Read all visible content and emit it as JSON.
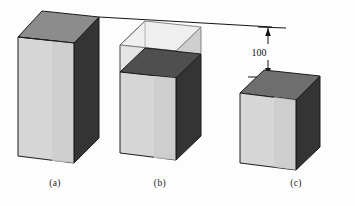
{
  "figure": {
    "background_color": "#fdfdfd",
    "palette": {
      "front_face": "#d6d6d6",
      "front_face_shade": "#c9c9c9",
      "right_face_dark": "#3a3a3a",
      "right_face_darker": "#2e2e2e",
      "top_face_mid": "#8f8f8f",
      "top_face_dark": "#555555",
      "ghost_fill": "#e3e3e3",
      "ghost_top": "#ececec",
      "ghost_right": "#cfcfcf",
      "outline": "#1c1c1c",
      "dimension_line": "#111111"
    },
    "dimension": {
      "value": "100",
      "kind": "vertical-height-difference"
    },
    "captions": [
      {
        "id": "a",
        "label": "(a)",
        "x": 55,
        "y": 186
      },
      {
        "id": "b",
        "label": "(b)",
        "x": 160,
        "y": 186
      },
      {
        "id": "c",
        "label": "(c)",
        "x": 296,
        "y": 186
      }
    ],
    "blocks": [
      {
        "id": "a",
        "name": "tall-block",
        "description": "Full height solid rectangular block",
        "solid": true,
        "ghost_top": false
      },
      {
        "id": "b",
        "name": "block-with-ghost-extension",
        "description": "Solid block with transparent wireframe volume on top reaching reference height",
        "solid": true,
        "ghost_top": true
      },
      {
        "id": "c",
        "name": "short-cube",
        "description": "Short solid cube offset 100 below the reference line",
        "solid": true,
        "ghost_top": false
      }
    ],
    "reference_line": {
      "name": "top-reference-line",
      "visible": true
    }
  }
}
